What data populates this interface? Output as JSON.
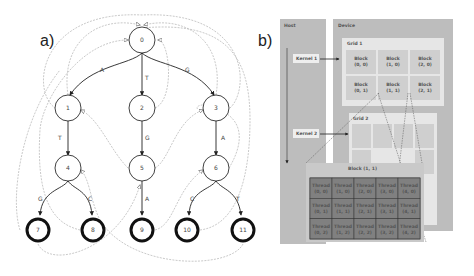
{
  "panels": {
    "a": {
      "label": "a)"
    },
    "b": {
      "label": "b)"
    }
  },
  "trie": {
    "nodes": [
      {
        "id": "0",
        "x": 142,
        "y": 40,
        "final": false
      },
      {
        "id": "1",
        "x": 68,
        "y": 108,
        "final": false
      },
      {
        "id": "2",
        "x": 142,
        "y": 108,
        "final": false
      },
      {
        "id": "3",
        "x": 216,
        "y": 108,
        "final": false
      },
      {
        "id": "4",
        "x": 68,
        "y": 168,
        "final": false
      },
      {
        "id": "5",
        "x": 142,
        "y": 168,
        "final": false
      },
      {
        "id": "6",
        "x": 216,
        "y": 168,
        "final": false
      },
      {
        "id": "7",
        "x": 38,
        "y": 230,
        "final": true
      },
      {
        "id": "8",
        "x": 93,
        "y": 230,
        "final": true
      },
      {
        "id": "9",
        "x": 142,
        "y": 230,
        "final": true
      },
      {
        "id": "10",
        "x": 187,
        "y": 230,
        "final": true
      },
      {
        "id": "11",
        "x": 243,
        "y": 230,
        "final": true
      }
    ],
    "edges": [
      {
        "from": "0",
        "to": "1",
        "label": "A"
      },
      {
        "from": "0",
        "to": "2",
        "label": "T"
      },
      {
        "from": "0",
        "to": "3",
        "label": "G"
      },
      {
        "from": "1",
        "to": "4",
        "label": "T"
      },
      {
        "from": "2",
        "to": "5",
        "label": "G"
      },
      {
        "from": "3",
        "to": "6",
        "label": "A"
      },
      {
        "from": "4",
        "to": "7",
        "label": "G"
      },
      {
        "from": "4",
        "to": "8",
        "label": "C"
      },
      {
        "from": "5",
        "to": "9",
        "label": "A"
      },
      {
        "from": "6",
        "to": "10",
        "label": "C"
      },
      {
        "from": "6",
        "to": "11",
        "label": "T"
      }
    ]
  },
  "cuda": {
    "host_label": "Host",
    "device_label": "Device",
    "kernel1": "Kernel 1",
    "kernel2": "Kernel 2",
    "grid1_label": "Grid 1",
    "grid2_label": "Grid 2",
    "grid1_blocks": [
      [
        "Block",
        "(0, 0)"
      ],
      [
        "Block",
        "(1, 0)"
      ],
      [
        "Block",
        "(2, 0)"
      ],
      [
        "Block",
        "(0, 1)"
      ],
      [
        "Block",
        "(1, 1)"
      ],
      [
        "Block",
        "(2, 1)"
      ]
    ],
    "block_detail_label": "Block (1, 1)",
    "threads": [
      [
        "Thread",
        "(0, 0)"
      ],
      [
        "Thread",
        "(1, 0)"
      ],
      [
        "Thread",
        "(2, 0)"
      ],
      [
        "Thread",
        "(3, 0)"
      ],
      [
        "Thread",
        "(4, 0)"
      ],
      [
        "Thread",
        "(0, 1)"
      ],
      [
        "Thread",
        "(1, 1)"
      ],
      [
        "Thread",
        "(2, 1)"
      ],
      [
        "Thread",
        "(3, 1)"
      ],
      [
        "Thread",
        "(4, 1)"
      ],
      [
        "Thread",
        "(0, 2)"
      ],
      [
        "Thread",
        "(1, 2)"
      ],
      [
        "Thread",
        "(2, 2)"
      ],
      [
        "Thread",
        "(3, 2)"
      ],
      [
        "Thread",
        "(4, 2)"
      ]
    ]
  }
}
